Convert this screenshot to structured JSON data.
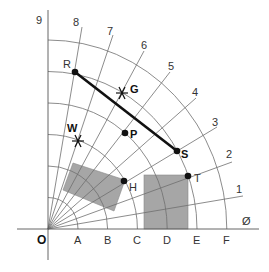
{
  "diagram": {
    "origin_label": "O",
    "axis_ticks": [
      "A",
      "B",
      "C",
      "D",
      "E",
      "F"
    ],
    "ray_labels": [
      "Ø",
      "1",
      "2",
      "3",
      "4",
      "5",
      "6",
      "7",
      "8",
      "9"
    ],
    "colors": {
      "grid": "#6e6e6e",
      "shade": "#a6a6a6",
      "segment": "#111111",
      "point": "#111111"
    },
    "points": [
      {
        "label": "R",
        "marker": "dot",
        "ring": "E",
        "ray": "8"
      },
      {
        "label": "S",
        "marker": "dot",
        "ring": "E",
        "ray": "3"
      },
      {
        "label": "G",
        "marker": "star",
        "ring": "E",
        "ray": "6"
      },
      {
        "label": "P",
        "marker": "dot",
        "ring": "D",
        "ray": "5"
      },
      {
        "label": "W",
        "marker": "star",
        "ring": "D",
        "ray": "7"
      },
      {
        "label": "H",
        "marker": "dot",
        "ring": "C",
        "ray": "3"
      },
      {
        "label": "T",
        "marker": "dot",
        "ring": "E",
        "ray": "2"
      }
    ],
    "segment": {
      "from": "R",
      "to": "S"
    },
    "shaded_shapes": [
      {
        "name": "rotated-rectangle",
        "corner_point": "H"
      },
      {
        "name": "upright-rectangle",
        "corner_point": "T"
      }
    ]
  }
}
